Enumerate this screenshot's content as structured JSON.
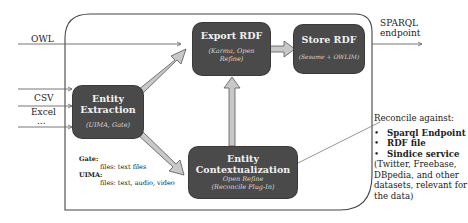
{
  "diagram": {
    "type": "data-flow",
    "inputs": {
      "owl": "OWL",
      "csv": "CSV",
      "excel": "Excel",
      "ellipsis": "..."
    },
    "output": {
      "line1": "SPARQL",
      "line2": "endpoint"
    },
    "nodes": {
      "entity_extraction": {
        "title_line1": "Entity",
        "title_line2": "Extraction",
        "subtitle": "(UIMA, Gate)"
      },
      "export_rdf": {
        "title": "Export RDF",
        "subtitle_line1": "(Karma, Open",
        "subtitle_line2": "Refine)"
      },
      "store_rdf": {
        "title": "Store RDF",
        "subtitle": "(Sesame + OWLIM)"
      },
      "entity_contextualization": {
        "title_line1": "Entity",
        "title_line2": "Contextualization",
        "subtitle_line1": "Open Refine",
        "subtitle_line2": "(Reconcile Plug-In)"
      }
    },
    "notes": {
      "gate_label": "Gate:",
      "gate_files": "files: text files",
      "uima_label": "UIMA:",
      "uima_files": "files: text,  audio, video"
    },
    "reconcile": {
      "heading": "Reconcile against:",
      "items": [
        "Sparql Endpoint",
        "RDF file",
        "Sindice service"
      ],
      "note": "(Twitter, Freebase, DBpedia, and other datasets, relevant for the data)"
    },
    "edges": [
      {
        "from": "OWL",
        "to": "Export RDF"
      },
      {
        "from": "CSV",
        "to": "Entity Extraction"
      },
      {
        "from": "Excel",
        "to": "Entity Extraction"
      },
      {
        "from": "...",
        "to": "Entity Extraction"
      },
      {
        "from": "Entity Extraction",
        "to": "Export RDF"
      },
      {
        "from": "Entity Extraction",
        "to": "Entity Contextualization"
      },
      {
        "from": "Entity Contextualization",
        "to": "Export RDF"
      },
      {
        "from": "Export RDF",
        "to": "Store RDF"
      },
      {
        "from": "Store RDF",
        "to": "SPARQL endpoint"
      },
      {
        "from": "Reconcile against",
        "to": "Entity Contextualization"
      }
    ],
    "colors": {
      "box_fill": "#4a4a4a",
      "box_text": "#f2f2f2",
      "arrow_fill": "#c8c8c8",
      "line": "#555555"
    }
  }
}
